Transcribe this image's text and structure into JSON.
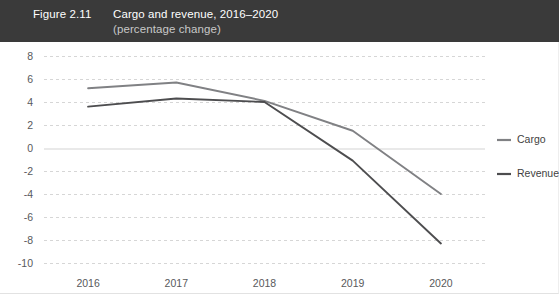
{
  "title_bar": {
    "figure_number": "Figure 2.11",
    "title": "Cargo and revenue, 2016–2020",
    "subtitle": "(percentage change)",
    "background_color": "#3a3a3a",
    "text_color": "#ffffff",
    "subtitle_color": "#c8c8c8"
  },
  "legend": {
    "position": "right",
    "entries": [
      {
        "label": "Cargo",
        "color": "#808184"
      },
      {
        "label": "Revenue",
        "color": "#4d4d4f"
      }
    ]
  },
  "axes": {
    "y_ticks": [
      "8",
      "6",
      "4",
      "2",
      "0",
      "-2",
      "-4",
      "-6",
      "-8",
      "-10"
    ],
    "x_ticks": [
      "2016",
      "2017",
      "2018",
      "2019",
      "2020"
    ]
  },
  "chart_data": {
    "type": "line",
    "title": "Cargo and revenue, 2016–2020",
    "subtitle": "(percentage change)",
    "xlabel": "",
    "ylabel": "",
    "categories": [
      "2016",
      "2017",
      "2018",
      "2019",
      "2020"
    ],
    "x": [
      2016,
      2017,
      2018,
      2019,
      2020
    ],
    "ylim": [
      -10,
      8
    ],
    "ytick_step": 2,
    "grid": true,
    "grid_style": "dashed-horizontal",
    "zero_line": true,
    "legend_position": "right",
    "series": [
      {
        "name": "Cargo",
        "color": "#808184",
        "values": [
          5.2,
          5.7,
          4.1,
          1.5,
          -4.0
        ]
      },
      {
        "name": "Revenue",
        "color": "#4d4d4f",
        "values": [
          3.6,
          4.3,
          4.0,
          -1.1,
          -8.3
        ]
      }
    ]
  }
}
